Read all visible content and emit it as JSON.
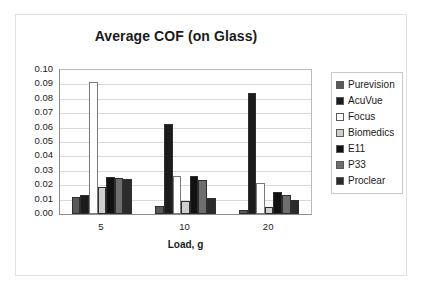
{
  "chart_data": {
    "type": "bar",
    "title": "Average COF (on Glass)",
    "xlabel": "Load, g",
    "ylabel": "",
    "categories": [
      "5",
      "10",
      "20"
    ],
    "ylim": [
      0.0,
      0.1
    ],
    "ytick_labels": [
      "0.10",
      "0.09",
      "0.08",
      "0.07",
      "0.06",
      "0.05",
      "0.04",
      "0.03",
      "0.02",
      "0.01",
      "0.00"
    ],
    "ytick_values": [
      0.1,
      0.09,
      0.08,
      0.07,
      0.06,
      0.05,
      0.04,
      0.03,
      0.02,
      0.01,
      0.0
    ],
    "grid": true,
    "legend_position": "right",
    "series": [
      {
        "name": "Purevision",
        "color": "#595959",
        "values": [
          0.012,
          0.0053,
          0.0025
        ]
      },
      {
        "name": "AcuVue",
        "color": "#1c1c1c",
        "values": [
          0.0135,
          0.0623,
          0.084
        ]
      },
      {
        "name": "Focus",
        "color": "#ffffff",
        "values": [
          0.0915,
          0.0265,
          0.0218
        ]
      },
      {
        "name": "Biomedics",
        "color": "#cfcfcf",
        "values": [
          0.0185,
          0.0092,
          0.0047
        ]
      },
      {
        "name": "E11",
        "color": "#111111",
        "values": [
          0.0255,
          0.0263,
          0.0152
        ]
      },
      {
        "name": "P33",
        "color": "#6e6e6e",
        "values": [
          0.0253,
          0.0233,
          0.0133
        ]
      },
      {
        "name": "Proclear",
        "color": "#2b2b2b",
        "values": [
          0.0242,
          0.0112,
          0.0098
        ]
      }
    ]
  },
  "legend": {
    "items": [
      {
        "label": "Purevision"
      },
      {
        "label": "AcuVue"
      },
      {
        "label": "Focus"
      },
      {
        "label": "Biomedics"
      },
      {
        "label": "E11"
      },
      {
        "label": "P33"
      },
      {
        "label": "Proclear"
      }
    ]
  }
}
